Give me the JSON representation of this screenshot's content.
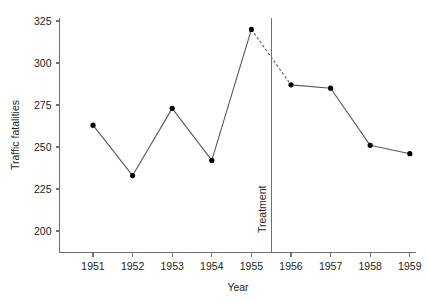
{
  "chart_data": {
    "type": "line",
    "title": "",
    "xlabel": "Year",
    "ylabel": "Traffic fatalities",
    "x": [
      1951,
      1952,
      1953,
      1954,
      1955,
      1956,
      1957,
      1958,
      1959
    ],
    "xtick_labels": [
      "1951",
      "1952",
      "1953",
      "1954",
      "1955",
      "1956",
      "1957",
      "1958",
      "1959"
    ],
    "ytick_labels": [
      "200",
      "225",
      "250",
      "275",
      "300",
      "325"
    ],
    "yticks": [
      200,
      225,
      250,
      275,
      300,
      325
    ],
    "ylim": [
      190,
      325
    ],
    "xlim": [
      1950.4,
      1959.6
    ],
    "grid": false,
    "legend": null,
    "series": [
      {
        "name": "Traffic fatalities",
        "values": [
          263,
          233,
          273,
          242,
          320,
          287,
          285,
          251,
          246
        ],
        "marker": "filled-circle",
        "line_style": "solid",
        "color": "#58595b"
      }
    ],
    "segments": [
      {
        "name": "pre-treatment",
        "style": "solid",
        "points": [
          {
            "x": 1951,
            "y": 263
          },
          {
            "x": 1952,
            "y": 233
          },
          {
            "x": 1953,
            "y": 273
          },
          {
            "x": 1954,
            "y": 242
          },
          {
            "x": 1955,
            "y": 320
          }
        ]
      },
      {
        "name": "counterfactual-transition",
        "style": "dashed",
        "points": [
          {
            "x": 1955,
            "y": 320
          },
          {
            "x": 1956,
            "y": 287
          }
        ]
      },
      {
        "name": "post-treatment",
        "style": "solid",
        "points": [
          {
            "x": 1956,
            "y": 287
          },
          {
            "x": 1957,
            "y": 285
          },
          {
            "x": 1958,
            "y": 251
          },
          {
            "x": 1959,
            "y": 246
          }
        ]
      }
    ],
    "annotations": [
      {
        "name": "treatment-marker",
        "label": "Treatment",
        "x": 1955.5,
        "orientation": "vertical",
        "rotation": -90,
        "color": "#6d6e71"
      }
    ],
    "colors": {
      "line": "#58595b",
      "marker": "#000000",
      "axis": "#6d6e71",
      "text": "#231f20",
      "background": "#ffffff",
      "treatment": "#6d6e71"
    }
  }
}
